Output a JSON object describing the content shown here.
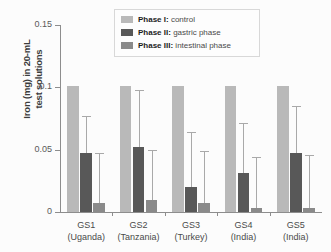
{
  "chart_data": {
    "type": "bar",
    "title": "",
    "xlabel": "",
    "ylabel": "Iron (mg) in 20-mL\ntest solutions",
    "ylim": [
      0,
      0.15
    ],
    "yticks": [
      "0",
      "0.05",
      "0.1",
      "0.15"
    ],
    "ytick_values": [
      0,
      0.05,
      0.1,
      0.15
    ],
    "grid": false,
    "legend_position": "top-center",
    "categories": [
      "GS1\n(Uganda)",
      "GS2\n(Tanzania)",
      "GS3\n(Turkey)",
      "GS4\n(India)",
      "GS5\n(India)"
    ],
    "category_codes": [
      "GS1",
      "GS2",
      "GS3",
      "GS4",
      "GS5"
    ],
    "category_origins": [
      "(Uganda)",
      "(Tanzania)",
      "(Turkey)",
      "(India)",
      "(India)"
    ],
    "series": [
      {
        "name": "Phase I: control",
        "label_bold": "Phase I:",
        "label_rest": " control",
        "color": "#b9b9b9",
        "values": [
          0.101,
          0.101,
          0.101,
          0.101,
          0.101
        ],
        "errors_high": [
          null,
          null,
          null,
          null,
          null
        ]
      },
      {
        "name": "Phase II: gastric phase",
        "label_bold": "Phase II:",
        "label_rest": " gastric phase",
        "color": "#585858",
        "values": [
          0.047,
          0.052,
          0.02,
          0.031,
          0.047
        ],
        "errors_high": [
          0.077,
          0.098,
          0.064,
          0.071,
          0.085
        ]
      },
      {
        "name": "Phase III: intestinal phase",
        "label_bold": "Phase III:",
        "label_rest": " intestinal phase",
        "color": "#8a8a8a",
        "values": [
          0.007,
          0.01,
          0.007,
          0.003,
          0.003
        ],
        "errors_high": [
          0.047,
          0.05,
          0.049,
          0.044,
          0.046
        ]
      }
    ]
  },
  "legend": {
    "items": [
      {
        "bold": "Phase I:",
        "rest": " control",
        "color": "#b9b9b9"
      },
      {
        "bold": "Phase II:",
        "rest": " gastric phase",
        "color": "#585858"
      },
      {
        "bold": "Phase III:",
        "rest": " intestinal phase",
        "color": "#8a8a8a"
      }
    ]
  }
}
